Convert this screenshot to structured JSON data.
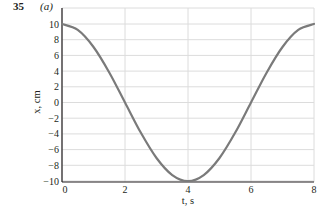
{
  "figure": {
    "number": "35",
    "part": "(a)"
  },
  "chart_data": {
    "type": "line",
    "title": "",
    "xlabel": "t, s",
    "ylabel": "x, cm",
    "xlim": [
      0,
      8
    ],
    "ylim": [
      -10,
      10
    ],
    "xticks": [
      0,
      2,
      4,
      6,
      8
    ],
    "yticks": [
      10,
      8,
      6,
      4,
      2,
      0,
      -2,
      -4,
      -6,
      -8,
      -10
    ],
    "grid": true,
    "series": [
      {
        "name": "x(t) = 10 cos(πt/4)",
        "color": "#7a7a7a",
        "x": [
          0,
          0.5,
          1,
          1.5,
          2,
          2.5,
          3,
          3.5,
          4,
          4.5,
          5,
          5.5,
          6,
          6.5,
          7,
          7.5,
          8
        ],
        "y": [
          10,
          9.24,
          7.07,
          3.83,
          0,
          -3.83,
          -7.07,
          -9.24,
          -10,
          -9.24,
          -7.07,
          -3.83,
          0,
          3.83,
          7.07,
          9.24,
          10
        ]
      }
    ]
  },
  "style": {
    "grid_color": "#dcdcdc",
    "axis_color": "#231f20",
    "curve_color": "#7a7a7a"
  }
}
